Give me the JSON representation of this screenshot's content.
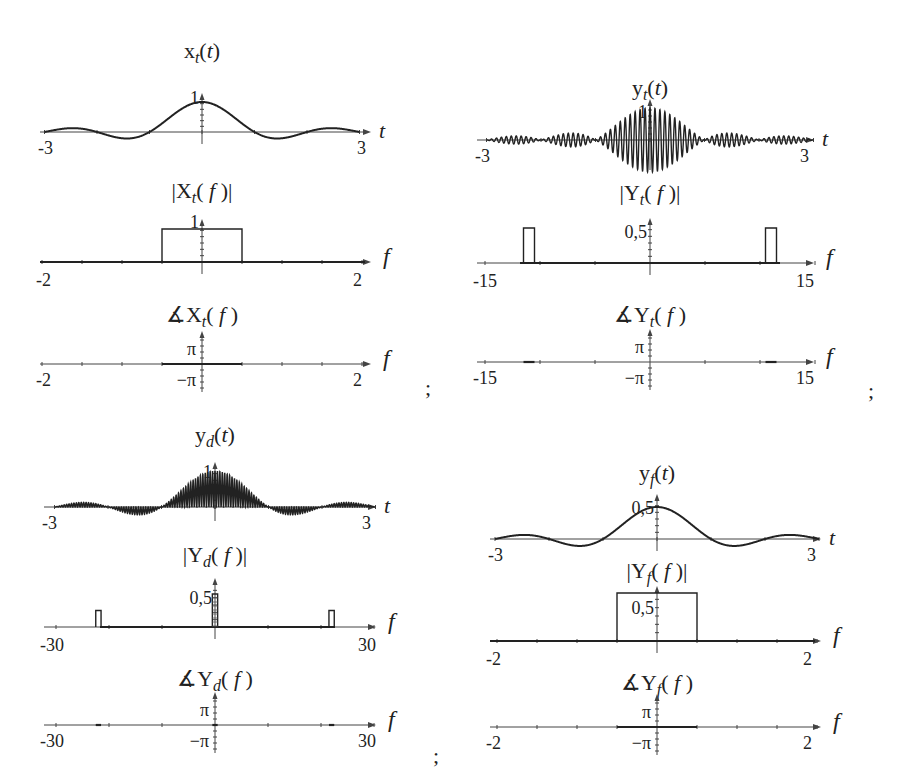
{
  "page": {
    "separators": [
      ";",
      ";",
      ";"
    ],
    "axis_var_time": "t",
    "axis_var_freq": "f",
    "phase_labels": {
      "pos": "π",
      "neg": "−π"
    }
  },
  "panels": {
    "xt": {
      "time_title": "x_t(t)",
      "time_title_base": "x",
      "time_title_sub": "t",
      "time_title_arg": "(t)",
      "time_peak_label": "1",
      "time_range_labels": [
        "-3",
        "3"
      ],
      "mag_title_base": "|X",
      "mag_title_sub": "t",
      "mag_title_arg": "( f )|",
      "mag_peak_label": "1",
      "freq_range_labels": [
        "-2",
        "2"
      ],
      "phase_title_base": "∡X",
      "phase_title_sub": "t",
      "phase_title_arg": "( f )"
    },
    "yt": {
      "time_title_base": "y",
      "time_title_sub": "t",
      "time_title_arg": "(t)",
      "time_peak_label": "1",
      "time_range_labels": [
        "-3",
        "3"
      ],
      "mag_title_base": "|Y",
      "mag_title_sub": "t",
      "mag_title_arg": "( f )|",
      "mag_peak_label": "0,5",
      "freq_range_labels": [
        "-15",
        "15"
      ],
      "phase_title_base": "∡Y",
      "phase_title_sub": "t",
      "phase_title_arg": "( f )"
    },
    "yd": {
      "time_title_base": "y",
      "time_title_sub": "d",
      "time_title_arg": "(t)",
      "time_peak_label": "1",
      "time_range_labels": [
        "-3",
        "3"
      ],
      "mag_title_base": "|Y",
      "mag_title_sub": "d",
      "mag_title_arg": "( f )|",
      "mag_peak_label": "0,5",
      "freq_range_labels": [
        "-30",
        "30"
      ],
      "phase_title_base": "∡Y",
      "phase_title_sub": "d",
      "phase_title_arg": "( f )"
    },
    "yf": {
      "time_title_base": "y",
      "time_title_sub": "f",
      "time_title_arg": "(t)",
      "time_peak_label": "0,5",
      "time_range_labels": [
        "-3",
        "3"
      ],
      "mag_title_base": "|Y",
      "mag_title_sub": "f",
      "mag_title_arg": "( f )|",
      "mag_peak_label": "0,5",
      "freq_range_labels": [
        "-2",
        "2"
      ],
      "phase_title_base": "∡Y",
      "phase_title_sub": "f",
      "phase_title_arg": "( f )"
    }
  },
  "chart_data": [
    {
      "type": "line",
      "title": "x_t(t)",
      "xlabel": "t",
      "xlim": [
        -3,
        3
      ],
      "ylim": [
        -0.25,
        1
      ],
      "function": "sinc(t) = sin(πt)/(πt)",
      "peak": 1,
      "zero_crossings": [
        -2,
        -1,
        1,
        2
      ]
    },
    {
      "type": "line",
      "title": "|X_t(f)|",
      "xlabel": "f",
      "xlim": [
        -2,
        2
      ],
      "ylim": [
        0,
        1
      ],
      "shape": "rect",
      "x": [
        -0.5,
        0.5
      ],
      "height": 1
    },
    {
      "type": "line",
      "title": "∡X_t(f)",
      "xlabel": "f",
      "xlim": [
        -2,
        2
      ],
      "yticks": [
        "π",
        "−π"
      ],
      "segments": [
        {
          "x": [
            -0.5,
            0.5
          ],
          "value": 0
        }
      ]
    },
    {
      "type": "line",
      "title": "y_t(t)",
      "xlabel": "t",
      "xlim": [
        -3,
        3
      ],
      "ylim": [
        -1,
        1
      ],
      "function": "sinc(t)·cos(2π·11t)",
      "envelope_peak": 1,
      "carrier_freq": 11
    },
    {
      "type": "line",
      "title": "|Y_t(f)|",
      "xlabel": "f",
      "xlim": [
        -15,
        15
      ],
      "ylim": [
        0,
        0.5
      ],
      "shape": "rects",
      "pulses": [
        {
          "x": [
            -11.5,
            -10.5
          ],
          "height": 0.5
        },
        {
          "x": [
            10.5,
            11.5
          ],
          "height": 0.5
        }
      ]
    },
    {
      "type": "line",
      "title": "∡Y_t(f)",
      "xlabel": "f",
      "xlim": [
        -15,
        15
      ],
      "yticks": [
        "π",
        "−π"
      ],
      "segments": [
        {
          "x": [
            -11.5,
            -10.5
          ],
          "value": 0
        },
        {
          "x": [
            10.5,
            11.5
          ],
          "value": 0
        }
      ]
    },
    {
      "type": "line",
      "title": "y_d(t)",
      "xlabel": "t",
      "xlim": [
        -3,
        3
      ],
      "ylim": [
        -0.25,
        1
      ],
      "function": "sinc(t)·cos²(2π·11t) (demodulated, contains 2·11 Hz ripple)",
      "envelope_peak": 1
    },
    {
      "type": "line",
      "title": "|Y_d(f)|",
      "xlabel": "f",
      "xlim": [
        -30,
        30
      ],
      "ylim": [
        0,
        0.5
      ],
      "shape": "rects",
      "pulses": [
        {
          "x": [
            -22.5,
            -21.5
          ],
          "height": 0.25
        },
        {
          "x": [
            -0.5,
            0.5
          ],
          "height": 0.5
        },
        {
          "x": [
            21.5,
            22.5
          ],
          "height": 0.25
        }
      ]
    },
    {
      "type": "line",
      "title": "∡Y_d(f)",
      "xlabel": "f",
      "xlim": [
        -30,
        30
      ],
      "yticks": [
        "π",
        "−π"
      ],
      "segments": [
        {
          "x": [
            -22.5,
            -21.5
          ],
          "value": 0
        },
        {
          "x": [
            -0.5,
            0.5
          ],
          "value": 0
        },
        {
          "x": [
            21.5,
            22.5
          ],
          "value": 0
        }
      ]
    },
    {
      "type": "line",
      "title": "y_f(t)",
      "xlabel": "t",
      "xlim": [
        -3,
        3
      ],
      "ylim": [
        -0.125,
        0.5
      ],
      "function": "0.5·sinc(t)",
      "peak": 0.5
    },
    {
      "type": "line",
      "title": "|Y_f(f)|",
      "xlabel": "f",
      "xlim": [
        -2,
        2
      ],
      "ylim": [
        0,
        0.5
      ],
      "shape": "rect",
      "x": [
        -0.5,
        0.5
      ],
      "height": 0.5
    },
    {
      "type": "line",
      "title": "∡Y_f(f)",
      "xlabel": "f",
      "xlim": [
        -2,
        2
      ],
      "yticks": [
        "π",
        "−π"
      ],
      "segments": [
        {
          "x": [
            -0.5,
            0.5
          ],
          "value": 0
        }
      ]
    }
  ]
}
